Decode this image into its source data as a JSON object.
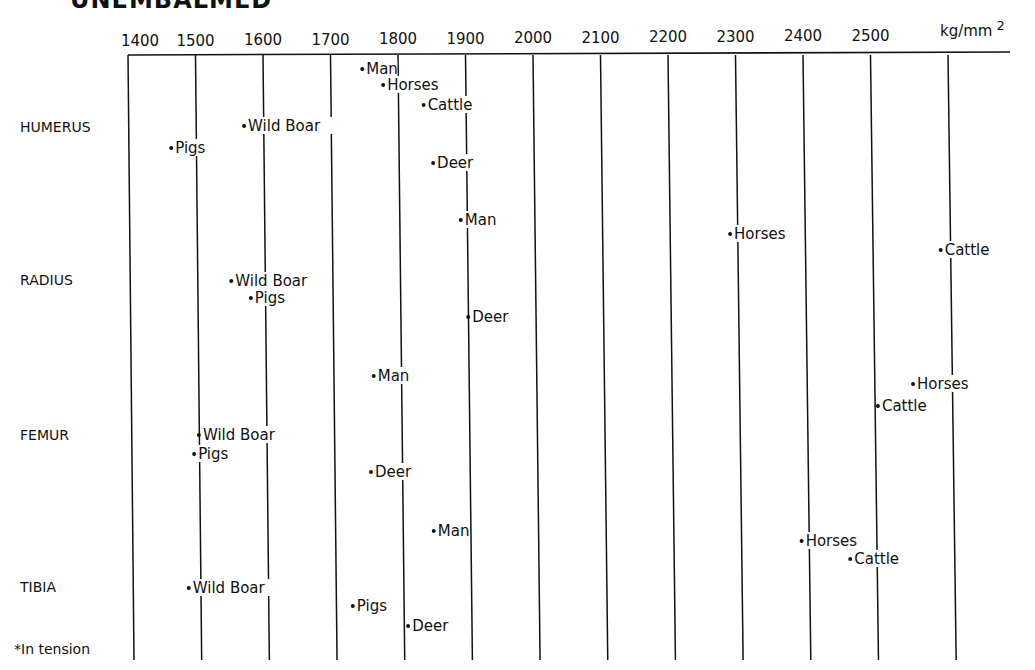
{
  "title": "UNEMBALMED",
  "title_rest": "COMPACT BONE ... (ULTIMATE STRENGTH)*",
  "chart_data": {
    "type": "scatter",
    "xlabel": "kg/mm",
    "xlabel_superscript": "2",
    "xlim": [
      1400,
      2600
    ],
    "x_ticks": [
      1400,
      1500,
      1600,
      1700,
      1800,
      1900,
      2000,
      2100,
      2200,
      2300,
      2400,
      2500
    ],
    "grid": true,
    "footnote": "*In tension",
    "categories": [
      "HUMERUS",
      "RADIUS",
      "FEMUR",
      "TIBIA"
    ],
    "series": [
      {
        "bone": "HUMERUS",
        "points": [
          {
            "name": "Man",
            "x": 1747,
            "order": 0
          },
          {
            "name": "Horses",
            "x": 1778,
            "order": 1
          },
          {
            "name": "Cattle",
            "x": 1838,
            "order": 2
          },
          {
            "name": "Wild Boar",
            "x": 1572,
            "order": 3
          },
          {
            "name": "Pigs",
            "x": 1464,
            "order": 4
          },
          {
            "name": "Deer",
            "x": 1852,
            "order": 5
          }
        ]
      },
      {
        "bone": "RADIUS",
        "points": [
          {
            "name": "Man",
            "x": 1893,
            "order": 0
          },
          {
            "name": "Horses",
            "x": 2292,
            "order": 1
          },
          {
            "name": "Cattle",
            "x": 2604,
            "order": 2
          },
          {
            "name": "Wild Boar",
            "x": 1553,
            "order": 3
          },
          {
            "name": "Pigs",
            "x": 1582,
            "order": 4
          },
          {
            "name": "Deer",
            "x": 1904,
            "order": 5
          }
        ]
      },
      {
        "bone": "FEMUR",
        "points": [
          {
            "name": "Man",
            "x": 1764,
            "order": 0
          },
          {
            "name": "Horses",
            "x": 2563,
            "order": 1
          },
          {
            "name": "Cattle",
            "x": 2511,
            "order": 2
          },
          {
            "name": "Wild Boar",
            "x": 1505,
            "order": 3
          },
          {
            "name": "Pigs",
            "x": 1498,
            "order": 4
          },
          {
            "name": "Deer",
            "x": 1760,
            "order": 5
          }
        ]
      },
      {
        "bone": "TIBIA",
        "points": [
          {
            "name": "Man",
            "x": 1853,
            "order": 0
          },
          {
            "name": "Horses",
            "x": 2398,
            "order": 1
          },
          {
            "name": "Cattle",
            "x": 2470,
            "order": 2
          },
          {
            "name": "Wild Boar",
            "x": 1490,
            "order": 3
          },
          {
            "name": "Pigs",
            "x": 1733,
            "order": 4
          },
          {
            "name": "Deer",
            "x": 1815,
            "order": 5
          }
        ]
      }
    ]
  }
}
